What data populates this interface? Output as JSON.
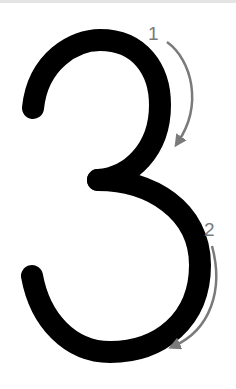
{
  "figure": {
    "digit": "3",
    "stroke_color": "#000000",
    "arrow_color": "#7a7a7a",
    "steps": [
      {
        "number": "1",
        "description": "upper curve stroke direction"
      },
      {
        "number": "2",
        "description": "lower curve stroke direction"
      }
    ]
  }
}
